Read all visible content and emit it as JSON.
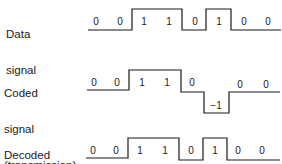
{
  "rows": [
    {
      "id": "data",
      "label_lines": [
        "Data",
        "signal"
      ],
      "bits": [
        "0",
        "0",
        "1",
        "1",
        "0",
        "1",
        "0",
        "0"
      ],
      "levels": [
        0,
        0,
        1,
        1,
        0,
        1,
        0,
        0
      ]
    },
    {
      "id": "coded",
      "label_lines": [
        "Coded",
        "signal",
        "(transmission)"
      ],
      "bits": [
        "0",
        "0",
        "1",
        "1",
        "0",
        "−1",
        "0",
        "0"
      ],
      "levels": [
        0,
        0,
        1,
        1,
        0,
        -1,
        0,
        0
      ]
    },
    {
      "id": "decoded",
      "label_lines": [
        "Decoded",
        "signal"
      ],
      "bits": [
        "0",
        "0",
        "1",
        "1",
        "0",
        "1",
        "0",
        "0"
      ],
      "levels": [
        0,
        0,
        1,
        1,
        0,
        1,
        0,
        0
      ]
    }
  ],
  "style": {
    "line_color": "#1a1a1a",
    "background": "#ffffff"
  }
}
